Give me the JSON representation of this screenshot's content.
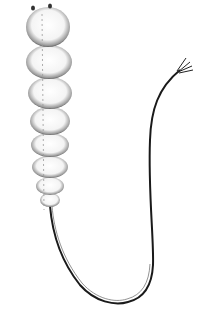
{
  "image": {
    "subject": "segmented larva with long tail (line illustration)",
    "background": "#ffffff",
    "ink": "#111111",
    "width": 207,
    "height": 317,
    "segments": [
      {
        "cx": 48,
        "cy": 27,
        "rx": 22,
        "ry": 20
      },
      {
        "cx": 49,
        "cy": 62,
        "rx": 23,
        "ry": 17
      },
      {
        "cx": 50,
        "cy": 93,
        "rx": 22,
        "ry": 16
      },
      {
        "cx": 50,
        "cy": 121,
        "rx": 20,
        "ry": 14
      },
      {
        "cx": 50,
        "cy": 145,
        "rx": 19,
        "ry": 12
      },
      {
        "cx": 50,
        "cy": 167,
        "rx": 18,
        "ry": 11
      },
      {
        "cx": 50,
        "cy": 186,
        "rx": 14,
        "ry": 9
      },
      {
        "cx": 50,
        "cy": 200,
        "rx": 10,
        "ry": 7
      }
    ]
  }
}
